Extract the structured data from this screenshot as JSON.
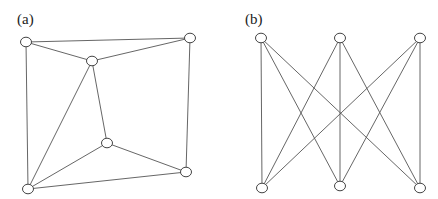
{
  "panels": [
    {
      "label": "(a)",
      "nodes": [
        {
          "id": "A"
        },
        {
          "id": "B"
        },
        {
          "id": "C"
        },
        {
          "id": "D"
        },
        {
          "id": "E"
        },
        {
          "id": "F"
        }
      ],
      "edges": [
        [
          "A",
          "B"
        ],
        [
          "A",
          "C"
        ],
        [
          "C",
          "B"
        ],
        [
          "A",
          "F"
        ],
        [
          "C",
          "F"
        ],
        [
          "C",
          "D"
        ],
        [
          "D",
          "F"
        ],
        [
          "D",
          "E"
        ],
        [
          "B",
          "E"
        ],
        [
          "F",
          "E"
        ]
      ]
    },
    {
      "label": "(b)",
      "nodes": [
        {
          "id": "T1"
        },
        {
          "id": "T2"
        },
        {
          "id": "T3"
        },
        {
          "id": "B1"
        },
        {
          "id": "B2"
        },
        {
          "id": "B3"
        }
      ],
      "edges": [
        [
          "T1",
          "B1"
        ],
        [
          "T1",
          "B2"
        ],
        [
          "T1",
          "B3"
        ],
        [
          "T2",
          "B1"
        ],
        [
          "T2",
          "B2"
        ],
        [
          "T2",
          "B3"
        ],
        [
          "T3",
          "B1"
        ],
        [
          "T3",
          "B2"
        ],
        [
          "T3",
          "B3"
        ]
      ]
    }
  ]
}
